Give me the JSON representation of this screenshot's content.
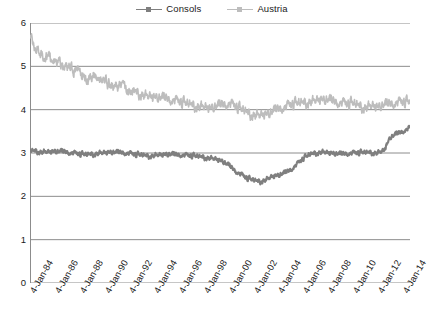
{
  "legend": {
    "position": "top-center",
    "entries": [
      {
        "label": "Consols",
        "color": "#7f7f7f",
        "marker": "square",
        "swatch_name": "legend-swatch-consols"
      },
      {
        "label": "Austria",
        "color": "#bdbdbd",
        "marker": "square",
        "swatch_name": "legend-swatch-austria"
      }
    ]
  },
  "axes": {
    "y_ticks": [
      "6",
      "5",
      "4",
      "3",
      "2",
      "1",
      "0"
    ],
    "x_ticks": [
      "4-Jan-84",
      "4-Jan-86",
      "4-Jan-88",
      "4-Jan-90",
      "4-Jan-92",
      "4-Jan-94",
      "4-Jan-96",
      "4-Jan-98",
      "4-Jan-00",
      "4-Jan-02",
      "4-Jan-04",
      "4-Jan-06",
      "4-Jan-08",
      "4-Jan-10",
      "4-Jan-12",
      "4-Jan-14"
    ]
  },
  "colors": {
    "consols": "#7f7f7f",
    "austria": "#bdbdbd",
    "gridline": "#8c8c8c",
    "axis": "#8c8c8c",
    "text": "#1a1a1a",
    "background": "#ffffff"
  },
  "chart_data": {
    "type": "line",
    "title": "",
    "subtitle": "",
    "xlabel": "",
    "ylabel": "",
    "xlim": [
      "4-Jan-84",
      "4-Jan-14"
    ],
    "ylim": [
      0,
      6
    ],
    "y_ticks": [
      0,
      1,
      2,
      3,
      4,
      5,
      6
    ],
    "x_tick_labels": [
      "4-Jan-84",
      "4-Jan-86",
      "4-Jan-88",
      "4-Jan-90",
      "4-Jan-92",
      "4-Jan-94",
      "4-Jan-96",
      "4-Jan-98",
      "4-Jan-00",
      "4-Jan-02",
      "4-Jan-04",
      "4-Jan-06",
      "4-Jan-08",
      "4-Jan-10",
      "4-Jan-12",
      "4-Jan-14"
    ],
    "grid": "horizontal",
    "legend_position": "top-center",
    "x_start_year": 1984,
    "x_end_year": 2014.6,
    "series": [
      {
        "name": "Consols",
        "color": "#7f7f7f",
        "x": [
          1984.0,
          1984.5,
          1985.0,
          1985.5,
          1986.0,
          1986.5,
          1987.0,
          1987.5,
          1988.0,
          1988.5,
          1989.0,
          1989.5,
          1990.0,
          1990.5,
          1991.0,
          1991.5,
          1992.0,
          1992.5,
          1993.0,
          1993.5,
          1994.0,
          1994.5,
          1995.0,
          1995.5,
          1996.0,
          1996.5,
          1997.0,
          1997.5,
          1998.0,
          1998.5,
          1999.0,
          1999.5,
          2000.0,
          2000.5,
          2001.0,
          2001.5,
          2002.0,
          2002.5,
          2003.0,
          2003.5,
          2004.0,
          2004.5,
          2005.0,
          2005.5,
          2006.0,
          2006.5,
          2007.0,
          2007.5,
          2008.0,
          2008.5,
          2009.0,
          2009.5,
          2010.0,
          2010.5,
          2011.0,
          2011.5,
          2012.0,
          2012.5,
          2013.0,
          2013.5,
          2014.0,
          2014.5
        ],
        "values": [
          3.05,
          3.04,
          3.02,
          3.02,
          3.03,
          3.02,
          3.0,
          2.98,
          2.96,
          2.95,
          2.97,
          2.99,
          3.0,
          3.01,
          3.0,
          2.99,
          2.97,
          2.95,
          2.94,
          2.93,
          2.94,
          2.95,
          2.96,
          2.95,
          2.94,
          2.93,
          2.92,
          2.91,
          2.9,
          2.88,
          2.85,
          2.8,
          2.7,
          2.58,
          2.48,
          2.4,
          2.36,
          2.34,
          2.38,
          2.45,
          2.48,
          2.52,
          2.6,
          2.72,
          2.86,
          2.95,
          3.0,
          3.02,
          3.0,
          2.98,
          2.96,
          2.97,
          2.98,
          2.99,
          3.0,
          3.01,
          3.0,
          3.05,
          3.35,
          3.42,
          3.48,
          3.55
        ]
      },
      {
        "name": "Austria",
        "color": "#bdbdbd",
        "x": [
          1984.0,
          1984.5,
          1985.0,
          1985.5,
          1986.0,
          1986.5,
          1987.0,
          1987.5,
          1988.0,
          1988.5,
          1989.0,
          1989.5,
          1990.0,
          1990.5,
          1991.0,
          1991.5,
          1992.0,
          1992.5,
          1993.0,
          1993.5,
          1994.0,
          1994.5,
          1995.0,
          1995.5,
          1996.0,
          1996.5,
          1997.0,
          1997.5,
          1998.0,
          1998.5,
          1999.0,
          1999.5,
          2000.0,
          2000.5,
          2001.0,
          2001.5,
          2002.0,
          2002.5,
          2003.0,
          2003.5,
          2004.0,
          2004.5,
          2005.0,
          2005.5,
          2006.0,
          2006.5,
          2007.0,
          2007.5,
          2008.0,
          2008.5,
          2009.0,
          2009.5,
          2010.0,
          2010.5,
          2011.0,
          2011.5,
          2012.0,
          2012.5,
          2013.0,
          2013.5,
          2014.0,
          2014.5
        ],
        "values": [
          5.7,
          5.45,
          5.3,
          5.2,
          5.15,
          5.05,
          4.95,
          4.9,
          4.88,
          4.8,
          4.7,
          4.72,
          4.65,
          4.55,
          4.6,
          4.52,
          4.45,
          4.4,
          4.35,
          4.3,
          4.28,
          4.25,
          4.22,
          4.18,
          4.15,
          4.12,
          4.1,
          4.08,
          4.05,
          4.02,
          4.05,
          4.08,
          4.1,
          4.05,
          3.98,
          3.92,
          3.88,
          3.86,
          3.88,
          3.92,
          3.98,
          4.02,
          4.08,
          4.12,
          4.15,
          4.18,
          4.2,
          4.22,
          4.2,
          4.15,
          4.12,
          4.1,
          4.12,
          4.08,
          4.05,
          4.08,
          4.05,
          4.08,
          4.1,
          4.12,
          4.14,
          4.15
        ]
      }
    ]
  }
}
